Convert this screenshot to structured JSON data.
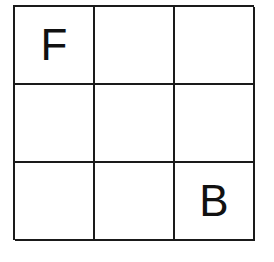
{
  "grid": {
    "rows": 3,
    "cols": 3,
    "cells": [
      [
        "F",
        "",
        ""
      ],
      [
        "",
        "",
        ""
      ],
      [
        "",
        "",
        "B"
      ]
    ]
  }
}
